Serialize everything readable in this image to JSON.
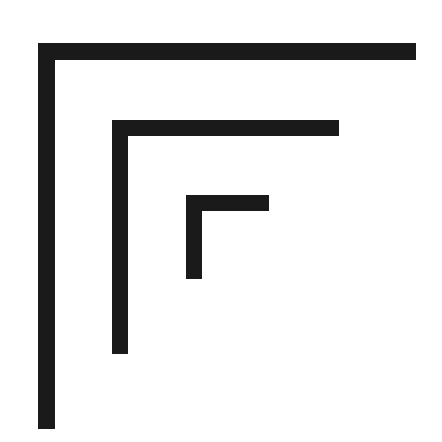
{
  "diagram": {
    "background": "#ffffff",
    "stroke_color": "#1a1a1a",
    "shapes": [
      {
        "name": "outer-bracket",
        "x": 38,
        "y": 43,
        "width": 378,
        "height": 386,
        "thickness": 17
      },
      {
        "name": "middle-bracket",
        "x": 112,
        "y": 120,
        "width": 227,
        "height": 234,
        "thickness": 16
      },
      {
        "name": "inner-bracket",
        "x": 186,
        "y": 195,
        "width": 83,
        "height": 84,
        "thickness": 16
      }
    ]
  }
}
